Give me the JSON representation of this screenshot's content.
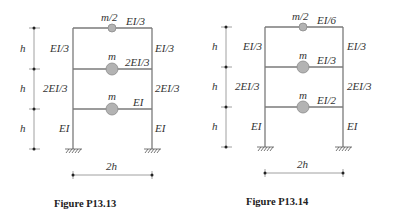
{
  "figures": [
    {
      "caption": "Figure P13.13",
      "story_height_label": "h",
      "width_label": "2h",
      "stories": [
        {
          "mass": "m/2",
          "beam": "EI/3",
          "col_left": "EI/3",
          "col_right": "EI/3"
        },
        {
          "mass": "m",
          "beam": "2EI/3",
          "col_left": "2EI/3",
          "col_right": "2EI/3"
        },
        {
          "mass": "m",
          "beam": "EI",
          "col_left": "EI",
          "col_right": "EI"
        }
      ]
    },
    {
      "caption": "Figure P13.14",
      "story_height_label": "h",
      "width_label": "2h",
      "stories": [
        {
          "mass": "m/2",
          "beam": "EI/6",
          "col_left": "EI/3",
          "col_right": "EI/3"
        },
        {
          "mass": "m",
          "beam": "EI/3",
          "col_left": "2EI/3",
          "col_right": "2EI/3"
        },
        {
          "mass": "m",
          "beam": "EI/2",
          "col_left": "EI",
          "col_right": "EI"
        }
      ]
    }
  ],
  "colors": {
    "member": "#7a7a7a",
    "mass": "#b3b3b3",
    "text": "#333333"
  }
}
